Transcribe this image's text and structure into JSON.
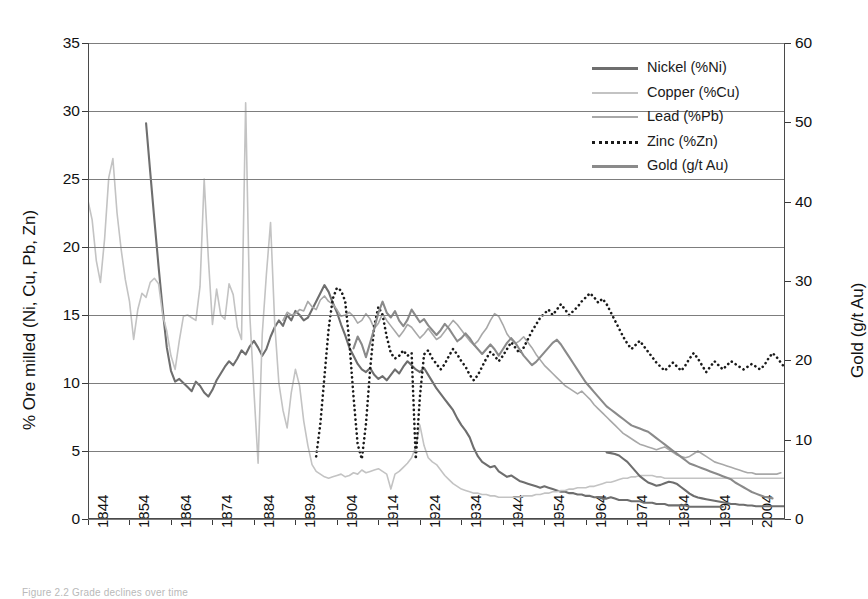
{
  "figure": {
    "caption": "Figure 2.2 Grade declines over time",
    "left_axis_label": "% Ore milled (Ni, Cu, Pb, Zn)",
    "right_axis_label": "Gold (g/t Au)"
  },
  "colors": {
    "nickel": "#6e6e6e",
    "copper": "#c3c3c3",
    "lead": "#a8a8a8",
    "zinc": "#1a1a1a",
    "gold": "#8a8a8a",
    "grid": "#7d7d7d",
    "axis": "#4a4a4a"
  },
  "legend": {
    "position": "top-right",
    "items": [
      {
        "label": "Nickel (%Ni)",
        "key": "nickel",
        "style": "solid"
      },
      {
        "label": "Copper (%Cu)",
        "key": "copper",
        "style": "solid"
      },
      {
        "label": "Lead (%Pb)",
        "key": "lead",
        "style": "solid"
      },
      {
        "label": "Zinc (%Zn)",
        "key": "zinc",
        "style": "dotted"
      },
      {
        "label": "Gold (g/t Au)",
        "key": "gold",
        "style": "solid"
      }
    ]
  },
  "chart_data": {
    "type": "line",
    "title": "",
    "xlabel": "",
    "ylabel": "% Ore milled (Ni, Cu, Pb, Zn)",
    "y2label": "Gold (g/t Au)",
    "xlim": [
      1844,
      2012
    ],
    "ylim": [
      0,
      35
    ],
    "y2lim": [
      0,
      60
    ],
    "yticks": [
      0,
      5,
      10,
      15,
      20,
      25,
      30,
      35
    ],
    "y2ticks": [
      0,
      10,
      20,
      30,
      40,
      50,
      60
    ],
    "xticks": [
      1844,
      1854,
      1864,
      1874,
      1884,
      1894,
      1904,
      1914,
      1924,
      1934,
      1944,
      1954,
      1964,
      1974,
      1984,
      1994,
      2004
    ],
    "grid": "horizontal",
    "legend_position": "top-right",
    "series": [
      {
        "name": "Nickel (%Ni)",
        "axis": "left",
        "color": "#6e6e6e",
        "style": "solid",
        "x0": 1858,
        "values": [
          29.1,
          25.5,
          22.0,
          18.6,
          15.4,
          12.6,
          10.9,
          10.1,
          10.3,
          10.0,
          9.7,
          9.4,
          10.1,
          9.8,
          9.3,
          9.0,
          9.5,
          10.2,
          10.7,
          11.2,
          11.6,
          11.3,
          11.8,
          12.4,
          12.1,
          12.7,
          13.1,
          12.6,
          12.0,
          12.5,
          13.4,
          14.1,
          14.6,
          14.2,
          15.0,
          14.6,
          15.3,
          15.0,
          14.6,
          14.8,
          15.4,
          16.0,
          16.6,
          17.2,
          16.7,
          15.9,
          15.2,
          14.3,
          13.5,
          12.6,
          12.0,
          11.4,
          11.0,
          10.8,
          11.1,
          10.6,
          10.3,
          10.5,
          10.2,
          10.6,
          11.0,
          10.7,
          11.2,
          11.6,
          11.3,
          11.0,
          10.8,
          11.1,
          10.6,
          10.1,
          9.6,
          9.2,
          8.8,
          8.4,
          8.0,
          7.4,
          6.9,
          6.5,
          6.0,
          5.2,
          4.6,
          4.2,
          4.0,
          3.8,
          3.9,
          3.5,
          3.3,
          3.1,
          3.2,
          3.0,
          2.8,
          2.7,
          2.6,
          2.5,
          2.4,
          2.3,
          2.4,
          2.3,
          2.2,
          2.1,
          2.0,
          2.0,
          1.9,
          1.9,
          1.8,
          1.8,
          1.7,
          1.7,
          1.6,
          1.6,
          1.5,
          1.5,
          1.6,
          1.5,
          1.4,
          1.4,
          1.4,
          1.3,
          1.3,
          1.3,
          1.2,
          1.2,
          1.2,
          1.1,
          1.1,
          1.1,
          1.0,
          1.0,
          1.0,
          1.0,
          1.0,
          0.9,
          0.9,
          0.9,
          0.9,
          0.9,
          0.9,
          0.9,
          0.9,
          0.9
        ]
      },
      {
        "name": "Copper (%Cu)",
        "axis": "left",
        "color": "#c3c3c3",
        "style": "solid",
        "x0": 1844,
        "values": [
          23.4,
          22.0,
          19.0,
          17.4,
          20.6,
          25.1,
          26.5,
          22.5,
          19.8,
          17.6,
          16.0,
          13.2,
          15.4,
          16.6,
          16.3,
          17.4,
          17.7,
          17.3,
          15.0,
          13.8,
          12.0,
          11.0,
          13.1,
          14.9,
          15.0,
          14.8,
          14.6,
          17.1,
          25.0,
          19.2,
          14.3,
          16.9,
          15.0,
          14.7,
          17.3,
          16.5,
          14.1,
          13.2,
          30.6,
          15.0,
          9.4,
          4.1,
          13.6,
          18.0,
          21.8,
          14.4,
          10.0,
          8.0,
          6.7,
          9.3,
          11.0,
          9.8,
          7.2,
          5.4,
          4.0,
          3.5,
          3.3,
          3.1,
          3.0,
          3.1,
          3.2,
          3.3,
          3.1,
          3.2,
          3.4,
          3.3,
          3.6,
          3.4,
          3.5,
          3.6,
          3.7,
          3.5,
          3.3,
          2.2,
          3.3,
          3.5,
          3.8,
          4.1,
          4.5,
          5.3,
          6.9,
          5.4,
          4.5,
          4.2,
          4.0,
          3.6,
          3.2,
          2.9,
          2.6,
          2.4,
          2.2,
          2.1,
          2.0,
          1.9,
          1.9,
          1.8,
          1.8,
          1.7,
          1.7,
          1.6,
          1.6,
          1.6,
          1.6,
          1.6,
          1.6,
          1.7,
          1.7,
          1.7,
          1.8,
          1.8,
          1.9,
          1.9,
          2.0,
          2.0,
          2.1,
          2.1,
          2.2,
          2.2,
          2.3,
          2.3,
          2.3,
          2.4,
          2.4,
          2.5,
          2.6,
          2.7,
          2.7,
          2.8,
          2.9,
          3.0,
          3.0,
          3.1,
          3.1,
          3.2,
          3.2,
          3.2,
          3.2,
          3.1,
          3.1,
          3.0,
          3.0,
          3.0,
          3.0,
          3.0,
          3.0,
          3.0,
          3.0,
          3.0,
          3.0,
          3.0,
          3.0,
          3.0,
          3.0,
          3.0,
          3.0,
          3.0,
          3.0,
          3.0,
          3.0,
          3.0,
          3.0,
          3.0,
          3.0,
          3.0,
          3.0,
          3.0,
          3.0,
          3.0,
          3.0
        ]
      },
      {
        "name": "Lead (%Pb)",
        "axis": "left",
        "color": "#a8a8a8",
        "style": "solid",
        "x0": 1891,
        "values": [
          14.6,
          15.2,
          15.0,
          15.1,
          15.4,
          15.3,
          16.0,
          15.6,
          15.4,
          16.1,
          16.4,
          16.0,
          15.8,
          15.4,
          14.9,
          15.0,
          15.2,
          14.9,
          14.4,
          14.6,
          15.1,
          14.7,
          14.0,
          14.4,
          15.1,
          14.6,
          14.2,
          13.8,
          13.4,
          13.8,
          14.3,
          14.1,
          13.7,
          13.3,
          13.6,
          14.0,
          13.6,
          13.2,
          13.4,
          13.8,
          14.2,
          14.6,
          14.3,
          13.9,
          13.5,
          13.1,
          12.8,
          13.1,
          13.6,
          14.0,
          14.6,
          15.1,
          14.9,
          14.3,
          13.6,
          13.2,
          12.9,
          13.1,
          13.4,
          13.0,
          12.6,
          12.1,
          11.7,
          11.3,
          11.0,
          10.7,
          10.4,
          10.1,
          9.8,
          9.6,
          9.4,
          9.2,
          9.4,
          9.1,
          8.8,
          8.4,
          8.1,
          7.8,
          7.5,
          7.2,
          6.9,
          6.6,
          6.3,
          6.1,
          5.9,
          5.7,
          5.5,
          5.4,
          5.3,
          5.2,
          5.1,
          5.2,
          5.3,
          5.1,
          4.9,
          4.7,
          4.6,
          4.5,
          4.6,
          4.8,
          5.0,
          4.8,
          4.6,
          4.4,
          4.2,
          4.1,
          4.0,
          3.9,
          3.8,
          3.7,
          3.6,
          3.5,
          3.4,
          3.4,
          3.3,
          3.3,
          3.3,
          3.3,
          3.3,
          3.3,
          3.4
        ]
      },
      {
        "name": "Zinc (%Zn)",
        "axis": "left",
        "color": "#1a1a1a",
        "style": "dotted",
        "x0": 1899,
        "values": [
          4.6,
          7.0,
          10.5,
          14.0,
          16.2,
          17.0,
          16.8,
          16.0,
          13.0,
          9.0,
          5.5,
          4.4,
          7.0,
          11.0,
          14.2,
          15.6,
          15.0,
          13.4,
          12.2,
          11.8,
          12.0,
          12.4,
          12.0,
          12.2,
          4.4,
          9.0,
          12.1,
          12.4,
          11.8,
          11.4,
          11.0,
          11.4,
          12.0,
          12.5,
          12.1,
          11.6,
          11.2,
          10.6,
          10.2,
          10.6,
          11.2,
          11.8,
          12.3,
          12.0,
          11.6,
          12.0,
          12.5,
          13.0,
          12.6,
          12.2,
          12.6,
          13.2,
          13.8,
          14.3,
          14.8,
          15.1,
          15.4,
          15.0,
          15.4,
          15.8,
          15.4,
          15.0,
          15.3,
          15.6,
          16.0,
          16.3,
          16.6,
          16.3,
          15.9,
          16.2,
          15.8,
          15.2,
          14.6,
          14.0,
          13.4,
          12.9,
          12.5,
          12.8,
          13.1,
          12.7,
          12.3,
          11.9,
          11.5,
          11.2,
          10.9,
          11.2,
          11.5,
          11.2,
          10.9,
          11.3,
          11.8,
          12.2,
          11.8,
          11.3,
          10.8,
          11.2,
          11.6,
          11.3,
          11.0,
          11.3,
          11.6,
          11.4,
          11.2,
          11.0,
          11.2,
          11.4,
          11.2,
          11.0,
          11.3,
          11.8,
          12.2,
          11.9,
          11.5,
          11.1,
          10.8,
          11.0,
          11.2,
          10.9,
          10.6,
          10.3
        ]
      },
      {
        "name": "Gold (g/t Au)",
        "axis": "right",
        "color": "#8a8a8a",
        "style": "solid",
        "x0": 1908,
        "values": [
          21.5,
          23.0,
          22.0,
          20.4,
          22.2,
          24.0,
          26.0,
          27.4,
          26.0,
          25.4,
          26.2,
          25.0,
          24.3,
          25.1,
          26.4,
          25.6,
          24.8,
          25.2,
          24.4,
          23.8,
          23.2,
          23.8,
          24.6,
          24.0,
          23.2,
          22.4,
          22.8,
          23.4,
          22.8,
          22.0,
          21.4,
          20.8,
          21.4,
          22.0,
          21.4,
          20.6,
          21.4,
          22.2,
          22.8,
          22.2,
          21.4,
          20.6,
          20.0,
          19.4,
          19.8,
          20.4,
          21.0,
          21.6,
          22.2,
          22.6,
          22.0,
          21.2,
          20.4,
          19.6,
          18.8,
          18.0,
          17.2,
          16.6,
          16.0,
          15.4,
          14.8,
          14.2,
          13.8,
          13.4,
          13.0,
          12.6,
          12.2,
          11.8,
          11.6,
          11.4,
          11.2,
          11.0,
          10.6,
          10.2,
          9.8,
          9.4,
          9.0,
          8.6,
          8.2,
          7.8,
          7.4,
          7.0,
          6.8,
          6.6,
          6.4,
          6.2,
          6.0,
          5.8,
          5.6,
          5.4,
          5.2,
          5.0,
          4.6,
          4.3,
          4.0,
          3.7,
          3.4,
          3.2,
          3.0,
          2.8,
          2.7,
          2.6
        ]
      },
      {
        "name": "Gold (g/t Au) segment",
        "axis": "right",
        "color": "#6e6e6e",
        "style": "solid",
        "x0": 1969,
        "values": [
          8.4,
          8.3,
          8.2,
          8.0,
          7.6,
          7.2,
          6.6,
          6.0,
          5.4,
          5.0,
          4.6,
          4.4,
          4.2,
          4.3,
          4.5,
          4.7,
          4.6,
          4.4,
          4.0,
          3.6,
          3.2,
          2.9,
          2.7,
          2.6,
          2.5,
          2.4,
          2.3,
          2.2,
          2.1,
          2.0,
          1.9,
          1.9,
          1.8,
          1.8,
          1.7,
          1.7,
          1.6,
          1.6,
          1.6,
          1.6,
          1.6,
          1.6,
          1.6,
          1.6
        ]
      }
    ]
  }
}
